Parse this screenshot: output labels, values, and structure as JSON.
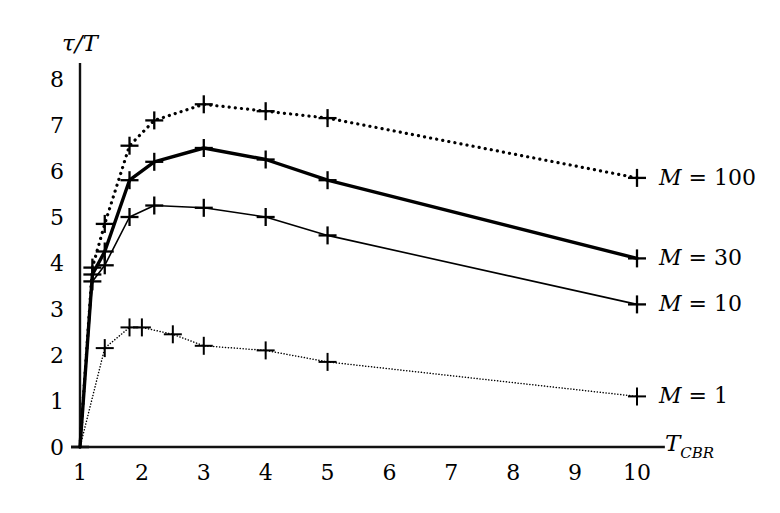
{
  "chart_data": {
    "type": "line",
    "title": "",
    "subtitle": "",
    "xlabel": "T_CBR",
    "xlabel_main": "T",
    "xlabel_sub": "CBR",
    "ylabel": "τ/T",
    "xlim": [
      1,
      10
    ],
    "ylim": [
      0,
      8
    ],
    "xticks": [
      1,
      2,
      3,
      4,
      5,
      6,
      7,
      8,
      9,
      10
    ],
    "xticklabels": [
      "1",
      "2",
      "3",
      "4",
      "5",
      "6",
      "7",
      "8",
      "9",
      "10"
    ],
    "yticks": [
      0,
      1,
      2,
      3,
      4,
      5,
      6,
      7,
      8
    ],
    "yticklabels": [
      "0",
      "1",
      "2",
      "3",
      "4",
      "5",
      "6",
      "7",
      "8"
    ],
    "grid": false,
    "legend_position": "right-inline-end-of-curve",
    "marker": "plus",
    "series": [
      {
        "name": "M = 100",
        "label_value": "100",
        "style": "dotted",
        "linewidth": 3.2,
        "color": "#000000",
        "x": [
          1.0,
          1.2,
          1.4,
          1.8,
          2.2,
          3.0,
          4.0,
          5.0,
          10.0
        ],
        "y": [
          0.0,
          3.9,
          4.85,
          6.55,
          7.1,
          7.45,
          7.3,
          7.15,
          5.85
        ]
      },
      {
        "name": "M = 30",
        "label_value": "30",
        "style": "solid",
        "linewidth": 3.4,
        "color": "#000000",
        "x": [
          1.0,
          1.2,
          1.4,
          1.8,
          2.2,
          3.0,
          4.0,
          5.0,
          10.0
        ],
        "y": [
          0.0,
          3.75,
          4.25,
          5.8,
          6.2,
          6.5,
          6.25,
          5.8,
          4.1
        ]
      },
      {
        "name": "M = 10",
        "label_value": "10",
        "style": "solid",
        "linewidth": 1.6,
        "color": "#000000",
        "x": [
          1.0,
          1.2,
          1.4,
          1.8,
          2.2,
          3.0,
          4.0,
          5.0,
          10.0
        ],
        "y": [
          0.0,
          3.6,
          3.95,
          5.0,
          5.25,
          5.2,
          5.0,
          4.6,
          3.1
        ]
      },
      {
        "name": "M = 1",
        "label_value": "1",
        "style": "dotted",
        "linewidth": 1.5,
        "color": "#000000",
        "x": [
          1.0,
          1.4,
          1.8,
          2.0,
          2.5,
          3.0,
          4.0,
          5.0,
          10.0
        ],
        "y": [
          0.0,
          2.15,
          2.6,
          2.6,
          2.45,
          2.2,
          2.1,
          1.85,
          1.1
        ]
      }
    ],
    "series_labels": [
      {
        "name": "M = 100",
        "var": "M",
        "eq": " = ",
        "value": "100"
      },
      {
        "name": "M = 30",
        "var": "M",
        "eq": " = ",
        "value": "30"
      },
      {
        "name": "M = 10",
        "var": "M",
        "eq": " = ",
        "value": "10"
      },
      {
        "name": "M = 1",
        "var": "M",
        "eq": " = ",
        "value": "1"
      }
    ]
  }
}
